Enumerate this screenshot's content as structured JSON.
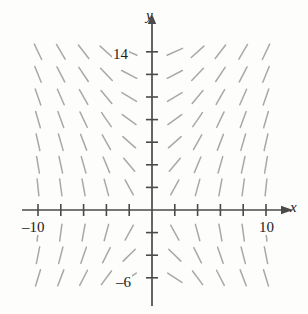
{
  "figure": {
    "kind": "slope-field",
    "title": "",
    "background_color": "#fdfdfc",
    "axis_color": "#4a4a4a",
    "segment_color": "#a8a8a8",
    "text_color": "#1c1c1c"
  },
  "axes": {
    "x_axis_label": "x",
    "y_axis_label": "y",
    "x_tick_label_left": "–10",
    "x_tick_label_right": "10",
    "y_tick_label_top": "14",
    "y_tick_label_bottom": "–6",
    "x_tick_count_left": 5,
    "x_tick_count_right": 5,
    "y_tick_count_above": 7,
    "y_tick_count_below": 3
  },
  "chart_data": {
    "type": "scatter",
    "title": "",
    "xlabel": "x",
    "ylabel": "y",
    "xlim": [
      -12,
      12
    ],
    "ylim": [
      -8,
      16
    ],
    "grid": false,
    "legend": null,
    "x_ticks": [
      -10,
      -8,
      -6,
      -4,
      -2,
      2,
      4,
      6,
      8,
      10
    ],
    "y_ticks": [
      -6,
      -4,
      -2,
      2,
      4,
      6,
      8,
      10,
      12,
      14
    ],
    "x_tick_labels": [
      "–10",
      "",
      "",
      "",
      "",
      "",
      "",
      "",
      "",
      "10"
    ],
    "y_tick_labels": [
      "–6",
      "",
      "",
      "",
      "",
      "",
      "",
      "",
      "",
      "14"
    ],
    "annotations": [],
    "segment_columns_x": [
      -10,
      -8,
      -6,
      -4,
      -2,
      2,
      4,
      6,
      8,
      10
    ],
    "segment_rows_y": [
      14,
      12,
      10,
      8,
      6,
      4,
      2,
      -2,
      -4,
      -6
    ],
    "slopes": [
      [
        -2.1,
        -1.7,
        -1.3,
        -0.9,
        -0.45,
        0.45,
        0.9,
        1.3,
        1.7,
        2.1
      ],
      [
        -2.45,
        -1.95,
        -1.5,
        -1.05,
        -0.52,
        0.52,
        1.05,
        1.5,
        1.95,
        2.45
      ],
      [
        -2.9,
        -2.3,
        -1.75,
        -1.22,
        -0.6,
        0.6,
        1.22,
        1.75,
        2.3,
        2.9
      ],
      [
        -3.5,
        -2.75,
        -2.1,
        -1.45,
        -0.72,
        0.72,
        1.45,
        2.1,
        2.75,
        3.5
      ],
      [
        -4.4,
        -3.45,
        -2.6,
        -1.8,
        -0.88,
        0.88,
        1.8,
        2.6,
        3.45,
        4.4
      ],
      [
        -6.0,
        -4.7,
        -3.5,
        -2.4,
        -1.18,
        1.18,
        2.4,
        3.5,
        4.7,
        6.0
      ],
      [
        -9.5,
        -7.4,
        -5.5,
        -3.7,
        -1.8,
        1.8,
        3.7,
        5.5,
        7.4,
        9.5
      ],
      [
        9.5,
        7.4,
        5.5,
        3.7,
        1.8,
        -1.8,
        -3.7,
        -5.5,
        -7.4,
        -9.5
      ],
      [
        5.0,
        3.9,
        2.9,
        2.0,
        0.98,
        -0.98,
        -2.0,
        -2.9,
        -3.9,
        -5.0
      ],
      [
        3.3,
        2.6,
        1.95,
        1.35,
        0.66,
        -0.66,
        -1.35,
        -1.95,
        -2.6,
        -3.3
      ]
    ],
    "segment_length_px": 17,
    "geometry": {
      "origin_px": [
        152,
        210
      ],
      "x_step_px": 22.8,
      "y_step_px": 22.6,
      "x_axis_y_px": 210,
      "y_axis_x_px": 152
    }
  }
}
